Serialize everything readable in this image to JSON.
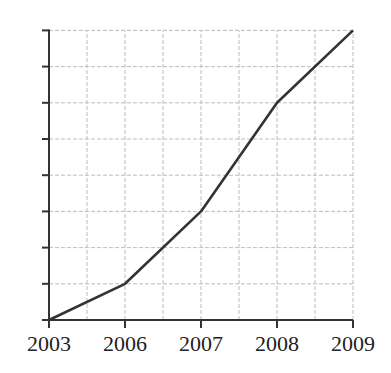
{
  "chart_data": {
    "type": "line",
    "title": "",
    "xlabel": "",
    "ylabel": "",
    "categories": [
      "2003",
      "2006",
      "2007",
      "2008",
      "2009"
    ],
    "values": [
      0,
      1,
      3,
      6,
      8
    ],
    "ylim": [
      0,
      8
    ],
    "y_ticks_count": 9,
    "y_tick_labels": [],
    "grid": true,
    "grid_style": "dashed light gray",
    "legend": null,
    "line_color": "#333333"
  },
  "layout": {
    "origin_x": 49,
    "origin_y": 320,
    "x_positions": [
      49,
      125,
      201,
      277,
      353
    ],
    "unit_px": 36.2,
    "grid_v_x": [
      49,
      87,
      125,
      163,
      201,
      239,
      277,
      315,
      353
    ],
    "top_y": 30
  }
}
